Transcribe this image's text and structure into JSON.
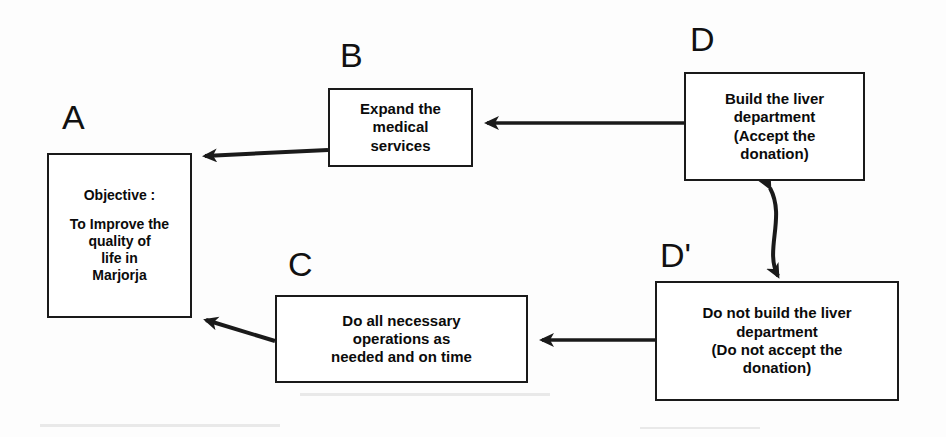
{
  "diagram": {
    "type": "flow-diagram",
    "background_color": "#fdfdfd",
    "stroke_color": "#1a1a1a",
    "text_color": "#0b0b0b",
    "nodes": [
      {
        "id": "A",
        "label": "A",
        "lines": [
          "Objective :",
          "",
          "To Improve the",
          "quality of",
          "life in",
          "Marjorja"
        ]
      },
      {
        "id": "B",
        "label": "B",
        "lines": [
          "Expand the",
          "medical",
          "services"
        ]
      },
      {
        "id": "C",
        "label": "C",
        "lines": [
          "Do all necessary",
          "operations as",
          "needed and on time"
        ]
      },
      {
        "id": "D",
        "label": "D",
        "lines": [
          "Build the liver",
          "department",
          "(Accept the",
          "donation)"
        ]
      },
      {
        "id": "Dprime",
        "label": "D'",
        "lines": [
          "Do not build the liver",
          "department",
          "(Do not accept the",
          "donation)"
        ]
      }
    ],
    "edges": [
      {
        "from": "B",
        "to": "A",
        "style": "single-arrow",
        "direction": "left-down"
      },
      {
        "from": "D",
        "to": "B",
        "style": "single-arrow",
        "direction": "left"
      },
      {
        "from": "D",
        "to": "Dprime",
        "style": "double-arrow",
        "direction": "vertical-curved"
      },
      {
        "from": "Dprime",
        "to": "C",
        "style": "single-arrow",
        "direction": "left"
      },
      {
        "from": "C",
        "to": "A",
        "style": "single-arrow",
        "direction": "left-up"
      }
    ]
  }
}
